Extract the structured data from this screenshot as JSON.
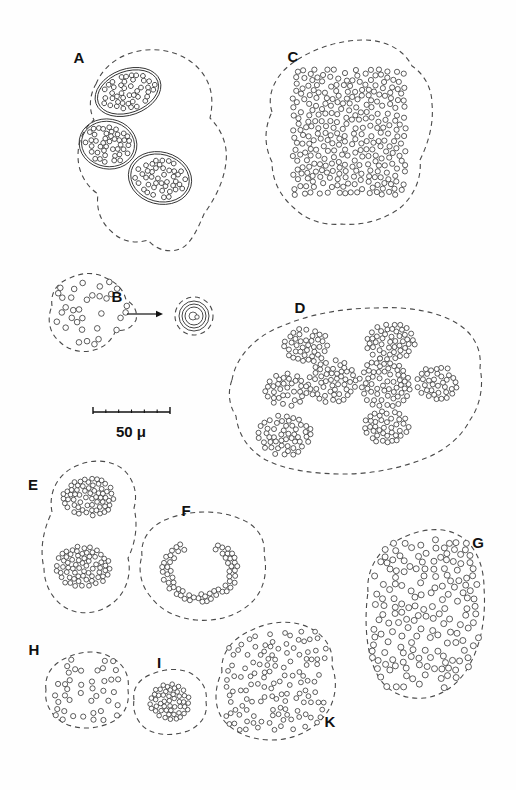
{
  "figure": {
    "type": "scientific-line-drawing-plate",
    "background_color": "#fefefe",
    "width": 516,
    "height": 790,
    "granule_fill": "#ffffff",
    "granule_stroke": "#2a2a2a",
    "outline_stroke": "#4a4a4a",
    "nucleus_stroke": "#333333",
    "label_color": "#111111"
  },
  "scale_bar": {
    "name": "scale-bar",
    "label": "50 μ",
    "value": 50,
    "unit": "μ",
    "x_start": 93,
    "x_end": 170,
    "y": 412,
    "label_x": 131,
    "label_y": 437,
    "interior_ticks": 5
  },
  "arrow": {
    "name": "transition-arrow",
    "x_start": 127,
    "x_end": 163,
    "y": 314
  },
  "panels": [
    {
      "id": "A",
      "label": "A",
      "label_x": 79,
      "label_y": 63,
      "description": "Cell with three double-walled nuclei each containing granule masses",
      "outline": "M 96,84 C 104,64 124,52 146,50 C 168,48 188,56 200,70 C 212,84 214,100 210,118 C 222,130 228,146 226,162 C 224,182 214,200 204,214 C 198,228 192,242 182,248 C 170,254 156,250 148,240 C 136,244 122,242 112,232 C 100,222 96,208 98,194 C 86,186 78,172 78,156 C 78,140 84,128 94,120 C 88,108 90,94 96,84 Z",
      "nuclei": [
        {
          "cx": 128,
          "cy": 92,
          "rx": 34,
          "ry": 23,
          "rot": -20
        },
        {
          "cx": 108,
          "cy": 144,
          "rx": 29,
          "ry": 25,
          "rot": 10
        },
        {
          "cx": 160,
          "cy": 178,
          "rx": 32,
          "ry": 26,
          "rot": 15
        }
      ],
      "granule_count": 128,
      "granule_radius": 2.4
    },
    {
      "id": "B",
      "label": "B",
      "label_x": 117,
      "label_y": 302,
      "description": "Cell with dispersed granules, arrow pointing to a small encysted body",
      "outline": "M 52,306 C 50,292 58,282 70,278 C 82,272 96,272 106,278 C 116,282 124,290 126,300 C 134,304 138,312 136,320 C 132,328 124,332 116,330 C 112,340 104,348 94,350 C 82,354 68,350 60,342 C 50,334 46,320 52,306 Z",
      "granule_count": 34,
      "granule_radius": 2.8,
      "inset": {
        "name": "cyst-inset",
        "cx": 194,
        "cy": 316,
        "outer_dashed_r": 19,
        "rings": [
          15,
          12,
          9
        ],
        "core_r": 4
      }
    },
    {
      "id": "C",
      "label": "C",
      "label_x": 293,
      "label_y": 62,
      "description": "Cell with large branching U-shaped dense granule mass",
      "outline": "M 272,112 C 266,94 276,74 294,62 C 314,48 340,40 364,40 C 386,40 404,50 412,66 C 424,74 432,88 432,104 C 434,124 428,144 420,160 C 422,178 414,196 400,208 C 384,220 362,226 342,224 C 324,226 306,220 294,208 C 280,196 272,180 272,162 C 264,146 264,128 272,112 Z",
      "granule_count": 300,
      "granule_radius": 2.6
    },
    {
      "id": "D",
      "label": "D",
      "label_x": 300,
      "label_y": 313,
      "description": "Large cell containing seven discrete granule clusters",
      "outline": "M 232,380 C 236,356 256,336 282,326 C 310,314 344,308 376,308 C 408,306 440,312 458,324 C 474,334 482,350 480,368 C 484,386 480,406 470,420 C 462,436 446,450 426,458 C 402,468 372,474 344,474 C 314,474 286,470 266,460 C 248,450 238,434 236,416 C 228,404 228,390 232,380 Z",
      "clusters": [
        {
          "cx": 307,
          "cy": 345,
          "rx": 23,
          "ry": 17,
          "count": 40
        },
        {
          "cx": 390,
          "cy": 342,
          "rx": 25,
          "ry": 19,
          "count": 48
        },
        {
          "cx": 333,
          "cy": 382,
          "rx": 25,
          "ry": 22,
          "count": 52
        },
        {
          "cx": 385,
          "cy": 383,
          "rx": 26,
          "ry": 25,
          "count": 60
        },
        {
          "cx": 437,
          "cy": 383,
          "rx": 21,
          "ry": 17,
          "count": 36
        },
        {
          "cx": 286,
          "cy": 390,
          "rx": 21,
          "ry": 17,
          "count": 34
        },
        {
          "cx": 386,
          "cy": 427,
          "rx": 24,
          "ry": 16,
          "count": 40
        },
        {
          "cx": 285,
          "cy": 435,
          "rx": 27,
          "ry": 21,
          "count": 52
        }
      ],
      "granule_radius": 2.5
    },
    {
      "id": "E",
      "label": "E",
      "label_x": 33,
      "label_y": 490,
      "description": "Elongated cell with two granule masses in dumbbell arrangement",
      "outline": "M 52,512 C 48,492 58,474 76,466 C 94,458 112,460 124,470 C 134,480 138,494 134,508 C 138,524 136,542 128,558 C 132,574 126,592 114,602 C 100,614 80,616 66,608 C 52,600 44,584 44,568 C 40,552 42,532 52,512 Z",
      "masses": [
        {
          "cx": 89,
          "cy": 497,
          "rx": 26,
          "ry": 19,
          "count": 62
        },
        {
          "cx": 83,
          "cy": 567,
          "rx": 27,
          "ry": 21,
          "count": 70
        }
      ],
      "granule_radius": 2.4
    },
    {
      "id": "F",
      "label": "F",
      "label_x": 186,
      "label_y": 516,
      "description": "Cell containing a horseshoe shaped ring of granules",
      "outline": "M 142,556 C 140,538 152,524 170,518 C 192,510 218,510 238,518 C 256,524 266,538 264,554 C 268,572 264,590 252,602 C 238,616 216,622 196,620 C 176,618 160,610 150,596 C 140,584 138,568 142,556 Z",
      "ring": {
        "cx": 200,
        "cy": 570,
        "rx": 36,
        "ry": 30,
        "start_deg": 300,
        "end_deg": 600,
        "count": 96
      },
      "granule_radius": 2.5
    },
    {
      "id": "G",
      "label": "G",
      "label_x": 478,
      "label_y": 548,
      "description": "Oval cell with granules evenly dispersed throughout",
      "outline": "M 368,592 C 366,570 378,550 398,540 C 420,528 444,526 460,536 C 476,546 484,566 484,588 C 486,614 482,640 472,660 C 462,682 444,696 424,698 C 402,700 384,690 376,672 C 366,652 364,620 368,592 Z",
      "granule_count": 170,
      "granule_radius": 3.0
    },
    {
      "id": "H",
      "label": "H",
      "label_x": 34,
      "label_y": 655,
      "description": "Small cell with sparse scattered granules",
      "outline": "M 46,690 C 44,676 52,664 66,658 C 82,650 100,650 112,658 C 124,664 130,676 128,690 C 130,704 124,716 112,722 C 96,730 76,730 62,722 C 50,714 44,702 46,690 Z",
      "granule_count": 42,
      "granule_radius": 2.6
    },
    {
      "id": "I",
      "label": "I",
      "label_x": 159,
      "label_y": 668,
      "description": "Small cell with a single dense compact granule ball",
      "outline": "M 134,700 C 132,688 140,678 152,674 C 166,668 182,668 192,674 C 202,680 208,690 206,702 C 208,714 202,724 190,730 C 176,736 160,736 148,730 C 138,724 132,712 134,700 Z",
      "mass": {
        "cx": 170,
        "cy": 702,
        "rx": 20,
        "ry": 18,
        "count": 115
      },
      "granule_radius": 2.3
    },
    {
      "id": "K",
      "label": "K",
      "label_x": 330,
      "label_y": 727,
      "description": "Kidney shaped cell with moderately scattered granules",
      "outline": "M 222,672 C 220,654 232,638 252,630 C 272,620 294,620 310,628 C 326,636 334,650 332,666 C 338,682 336,700 326,714 C 314,730 294,740 272,740 C 250,740 232,732 222,718 C 214,706 214,688 222,672 Z",
      "granule_count": 130,
      "granule_radius": 2.4
    }
  ]
}
